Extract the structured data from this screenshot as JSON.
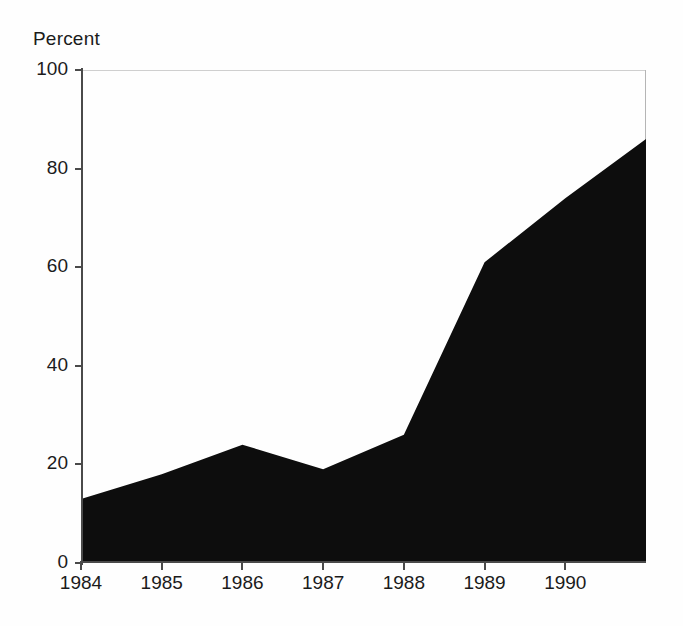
{
  "chart_data": {
    "type": "area",
    "title": "",
    "subtitle": "",
    "xlabel": "",
    "ylabel": "Percent",
    "ylim": [
      0,
      100
    ],
    "xlim": [
      1984,
      1991
    ],
    "grid": false,
    "legend": null,
    "fill_color": "#0d0d0d",
    "categories": [
      "1984",
      "1985",
      "1986",
      "1987",
      "1988",
      "1989",
      "1990",
      "1991"
    ],
    "x": [
      1984,
      1985,
      1986,
      1987,
      1988,
      1989,
      1990,
      1991
    ],
    "values": [
      13,
      18,
      24,
      19,
      26,
      61,
      74,
      86
    ],
    "series": [
      {
        "name": "Percent",
        "values": [
          13,
          18,
          24,
          19,
          26,
          61,
          74,
          86
        ]
      }
    ],
    "y_ticks": [
      0,
      20,
      40,
      60,
      80,
      100
    ],
    "y_tick_labels": [
      "0",
      "20",
      "40",
      "60",
      "80",
      "100"
    ],
    "x_ticks": [
      1984,
      1985,
      1986,
      1987,
      1988,
      1989,
      1990
    ],
    "x_tick_labels": [
      "1984",
      "1985",
      "1986",
      "1987",
      "1988",
      "1989",
      "1990"
    ],
    "annotations": []
  },
  "axis": {
    "y_title": "Percent"
  }
}
